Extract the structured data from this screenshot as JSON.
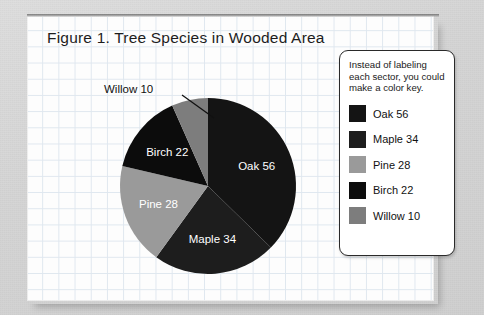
{
  "figure": {
    "title": "Figure 1. Tree Species in Wooded Area"
  },
  "legend": {
    "note": "Instead of labeling each sector, you could make a color key.",
    "items": [
      {
        "label": "Oak 56",
        "color": "#141414"
      },
      {
        "label": "Maple 34",
        "color": "#1d1d1d"
      },
      {
        "label": "Pine 28",
        "color": "#9a9a9a"
      },
      {
        "label": "Birch 22",
        "color": "#0c0c0c"
      },
      {
        "label": "Willow 10",
        "color": "#7d7d7d"
      }
    ]
  },
  "callout": {
    "willow_label": "Willow 10"
  },
  "chart_data": {
    "type": "pie",
    "title": "Figure 1. Tree Species in Wooded Area",
    "total": 150,
    "start_angle_deg": 0,
    "direction": "clockwise",
    "categories": [
      "Oak",
      "Maple",
      "Pine",
      "Birch",
      "Willow"
    ],
    "values": [
      56,
      34,
      28,
      22,
      10
    ],
    "labels": [
      "Oak 56",
      "Maple 34",
      "Pine 28",
      "Birch 22",
      "Willow 10"
    ],
    "colors": [
      "#141414",
      "#1d1d1d",
      "#9a9a9a",
      "#0c0c0c",
      "#7d7d7d"
    ],
    "angles_deg": [
      134.4,
      81.6,
      67.2,
      52.8,
      24.0
    ],
    "label_placement": [
      "inside",
      "inside",
      "inside",
      "inside",
      "callout"
    ],
    "legend_position": "right",
    "grid": true,
    "xlabel": "",
    "ylabel": ""
  }
}
